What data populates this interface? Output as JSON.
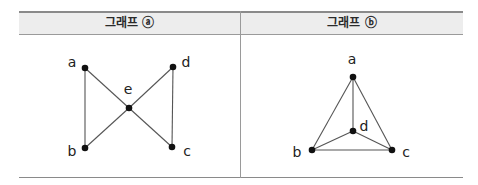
{
  "table": {
    "headers": [
      "그래프 ⓐ",
      "그래프 ⓑ"
    ]
  },
  "graph_a": {
    "title": "그래프 ⓐ",
    "vertices": [
      {
        "id": "a",
        "label": "a",
        "x": 85,
        "y": 68,
        "lx": 72,
        "ly": 67
      },
      {
        "id": "d",
        "label": "d",
        "x": 173,
        "y": 67,
        "lx": 186,
        "ly": 67
      },
      {
        "id": "e",
        "label": "e",
        "x": 129,
        "y": 108,
        "lx": 128,
        "ly": 94
      },
      {
        "id": "b",
        "label": "b",
        "x": 85,
        "y": 148,
        "lx": 72,
        "ly": 156
      },
      {
        "id": "c",
        "label": "c",
        "x": 172,
        "y": 147,
        "lx": 187,
        "ly": 156
      }
    ],
    "edges": [
      [
        "a",
        "b"
      ],
      [
        "a",
        "e"
      ],
      [
        "e",
        "c"
      ],
      [
        "d",
        "e"
      ],
      [
        "e",
        "b"
      ],
      [
        "d",
        "c"
      ]
    ]
  },
  "graph_b": {
    "title": "그래프 ⓑ",
    "vertices": [
      {
        "id": "a",
        "label": "a",
        "x": 353,
        "y": 77,
        "lx": 352,
        "ly": 64
      },
      {
        "id": "d",
        "label": "d",
        "x": 353,
        "y": 131,
        "lx": 364,
        "ly": 131
      },
      {
        "id": "b",
        "label": "b",
        "x": 312,
        "y": 150,
        "lx": 297,
        "ly": 157
      },
      {
        "id": "c",
        "label": "c",
        "x": 392,
        "y": 150,
        "lx": 406,
        "ly": 157
      }
    ],
    "edges": [
      [
        "a",
        "b"
      ],
      [
        "a",
        "c"
      ],
      [
        "a",
        "d"
      ],
      [
        "b",
        "c"
      ],
      [
        "b",
        "d"
      ],
      [
        "c",
        "d"
      ]
    ]
  },
  "colors": {
    "edge": "#555555",
    "vertex": "#111111",
    "header_bg": "#ededed",
    "border": "#8a8a8a"
  }
}
